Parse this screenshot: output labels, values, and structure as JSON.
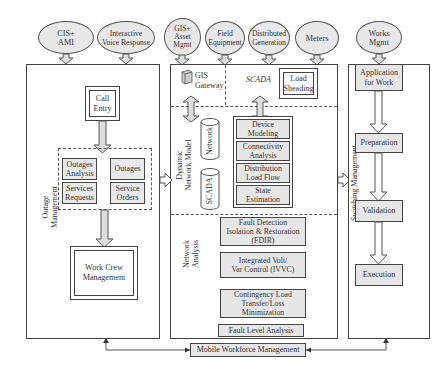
{
  "sources": [
    {
      "id": "cis-ami",
      "label": "CIS+\nAMI"
    },
    {
      "id": "ivr",
      "label": "Interactive\nVoice Response"
    },
    {
      "id": "gis-asset",
      "label": "GIS+\nAsset\nMgmt"
    },
    {
      "id": "field-equipment",
      "label": "Field\nEquipment"
    },
    {
      "id": "distributed-generation",
      "label": "Distributed\nGeneration"
    },
    {
      "id": "meters",
      "label": "Meters"
    },
    {
      "id": "works-mgmt",
      "label": "Works\nMgmt"
    }
  ],
  "outage_management": {
    "section_label": "Outage\nManagement",
    "call_entry": "Call\nEntry",
    "outages_analysis": "Outages\nAnalysis",
    "services_requests": "Services\nRequests",
    "outages": "Outages",
    "service_orders": "Service\nOrders",
    "work_crew": "Work Crew\nManagement"
  },
  "center": {
    "gis_gateway": "GIS\nGateway",
    "scada_label": "SCADA",
    "load_shedding": "Load\nSheading",
    "dynamic_network_model_label": "Dynamic\nNetwork Model",
    "network_db": "Network",
    "scada_db": "SCADA",
    "device_modeling": "Device\nModeling",
    "connectivity_analysis": "Connectivity\nAnalysis",
    "distribution_load_flow": "Distribution\nLoad Flow",
    "state_estimation": "State\nEstimation",
    "network_analysis_label": "Network\nAnalysis",
    "fdir": "Fault Detection\nIsolation & Restoration\n(FDIR)",
    "ivvc": "Integrated Volt/\nVar Control (IVVC)",
    "contingency": "Contingency Load\nTransfer/Loss\nMinimization",
    "fault_level": "Fault Level Analysis"
  },
  "switching_management": {
    "section_label": "Switching Management",
    "steps": [
      "Application\nfor Work",
      "Preparation",
      "Validation",
      "Execution"
    ]
  },
  "mobile_workforce": "Mobile Workforce Management"
}
